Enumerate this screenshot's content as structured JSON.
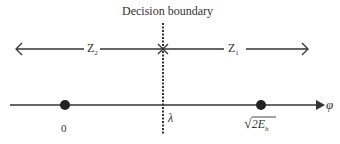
{
  "diagram": {
    "boundary_label": "Decision boundary",
    "regions": [
      {
        "name": "Z2",
        "main": "Z",
        "sub": "2",
        "direction": "left"
      },
      {
        "name": "Z1",
        "main": "Z",
        "sub": "1",
        "direction": "right"
      }
    ],
    "axis": {
      "label": "φ",
      "threshold_label": "λ",
      "points": [
        {
          "label": "0"
        },
        {
          "label_radical": "√",
          "label_body": "2E",
          "label_sub": "b"
        }
      ]
    },
    "colors": {
      "line": "#333333",
      "text": "#333333",
      "background": "#ffffff"
    }
  }
}
